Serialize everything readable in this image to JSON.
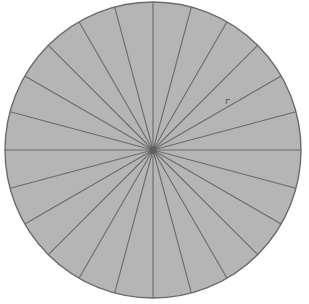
{
  "diagram": {
    "center": {
      "x": 153,
      "y": 150
    },
    "radius": 148,
    "sector_count": 24,
    "labels": {
      "radius_label": "r"
    },
    "colors": {
      "fill": "#b5b5b5",
      "stroke": "#6b6b6b",
      "hub": "#5e5e5e",
      "background": "#ffffff"
    }
  }
}
